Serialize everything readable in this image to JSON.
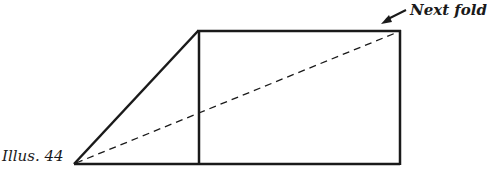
{
  "figure": {
    "caption": "Illus. 44",
    "annotation": "Next fold",
    "colors": {
      "line": "#1a1a1a",
      "background": "#ffffff"
    },
    "shapes": {
      "trapezoid_outline": "solid",
      "fold_line": "dashed",
      "arrow": "pointing-down-left-to-top-right-corner"
    }
  }
}
